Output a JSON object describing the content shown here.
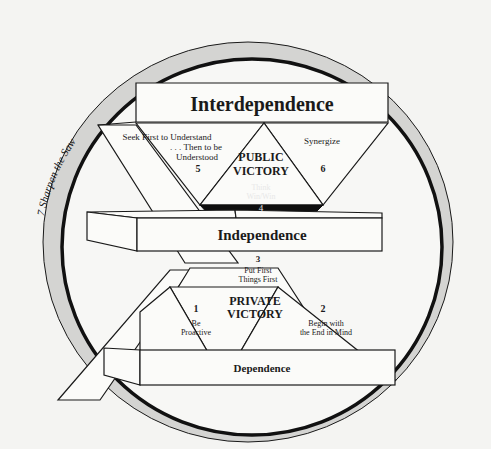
{
  "diagram": {
    "levels": {
      "interdependence": "Interdependence",
      "independence": "Independence",
      "dependence": "Dependence"
    },
    "victories": {
      "public_line1": "PUBLIC",
      "public_line2": "VICTORY",
      "private_line1": "PRIVATE",
      "private_line2": "VICTORY"
    },
    "habits": [
      {
        "number": "1",
        "line1": "Be",
        "line2": "Proactive"
      },
      {
        "number": "2",
        "line1": "Begin with",
        "line2": "the End in Mind"
      },
      {
        "number": "3",
        "line1": "Put First",
        "line2": "Things First"
      },
      {
        "number": "4",
        "line1": "Think",
        "line2": "Win/Win"
      },
      {
        "number": "5",
        "line1": "Seek First to Understand",
        "line2": ". . . Then to be",
        "line3": "Understood"
      },
      {
        "number": "6",
        "line1": "Synergize"
      },
      {
        "number": "7",
        "line1": "Sharpen the Saw"
      }
    ],
    "ring_label": "7  Sharpen the Saw",
    "colors": {
      "ring_fill": "#d4d4d2",
      "outline": "#1a1a1a",
      "box_fill": "#fbfbf9",
      "dark_fill": "#0f0f0f",
      "background": "#f4f4f2"
    }
  }
}
